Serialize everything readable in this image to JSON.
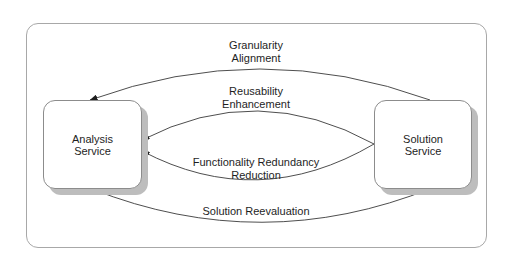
{
  "diagram": {
    "nodes": [
      {
        "id": "analysis",
        "lines": [
          "Analysis",
          "Service"
        ]
      },
      {
        "id": "solution",
        "lines": [
          "Solution",
          "Service"
        ]
      }
    ],
    "edges": [
      {
        "from": "solution",
        "to": "analysis",
        "lines": [
          "Granularity",
          "Alignment"
        ]
      },
      {
        "from": "solution",
        "to": "analysis",
        "lines": [
          "Reusability",
          "Enhancement"
        ]
      },
      {
        "from": "solution",
        "to": "analysis",
        "lines": [
          "Functionality Redundancy",
          "Reduction"
        ]
      },
      {
        "from": "solution",
        "to": "analysis",
        "lines": [
          "Solution Reevaluation"
        ]
      }
    ]
  },
  "colors": {
    "stroke": "#3a3a3a",
    "container_border": "#a8a8a8",
    "shadow": "#bdbdbd",
    "node_fill": "#ffffff"
  }
}
